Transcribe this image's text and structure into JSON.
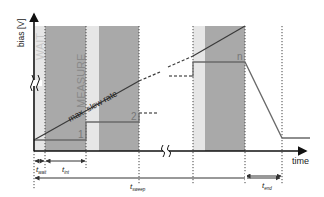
{
  "diagram": {
    "y_axis_label": "bias [V]",
    "x_axis_label": "time",
    "phase_labels": {
      "wait": "WAIT",
      "measure": "MEASURE"
    },
    "slope_label": "max. slew rate",
    "step_labels": [
      "1",
      "2",
      "n"
    ],
    "durations": [
      {
        "symbol": "t",
        "subscript": "wait"
      },
      {
        "symbol": "t",
        "subscript": "int"
      },
      {
        "symbol": "t",
        "subscript": "sweep"
      },
      {
        "symbol": "t",
        "subscript": "end"
      }
    ],
    "axis_break_glyph": "≈"
  }
}
